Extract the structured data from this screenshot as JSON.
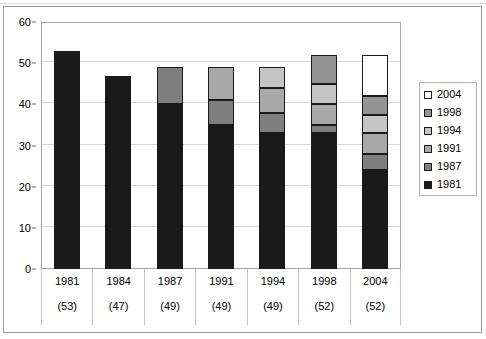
{
  "chart_data": {
    "type": "bar",
    "subtype": "stacked-bar",
    "title": "",
    "subtitle": "",
    "xlabel": "",
    "ylabel": "",
    "ylim": [
      0,
      60
    ],
    "ytick_step": 10,
    "yticks": [
      0,
      10,
      20,
      30,
      40,
      50,
      60
    ],
    "ytick_labels": [
      "0",
      "10",
      "20",
      "30",
      "40",
      "50",
      "60"
    ],
    "grid": true,
    "grid_axis": "y",
    "legend_position": "right",
    "categories": [
      "1981",
      "1984",
      "1987",
      "1991",
      "1994",
      "1998",
      "2004"
    ],
    "category_sublabels": [
      "(53)",
      "(47)",
      "(49)",
      "(49)",
      "(49)",
      "(52)",
      "(52)"
    ],
    "series": [
      {
        "name": "1981",
        "color": "#1a1a1a",
        "values": [
          53,
          47,
          40,
          35,
          33,
          33,
          24
        ]
      },
      {
        "name": "1987",
        "color": "#7f7f7f",
        "values": [
          0,
          0,
          9,
          6,
          5,
          2,
          4
        ]
      },
      {
        "name": "1991",
        "color": "#a8a8a8",
        "values": [
          0,
          0,
          0,
          8,
          6,
          5,
          5
        ]
      },
      {
        "name": "1994",
        "color": "#c4c4c4",
        "values": [
          0,
          0,
          0,
          0,
          5,
          5,
          4.5
        ]
      },
      {
        "name": "1998",
        "color": "#949494",
        "values": [
          0,
          0,
          0,
          0,
          0,
          7,
          4.5
        ]
      },
      {
        "name": "2004",
        "color": "#ffffff",
        "values": [
          0,
          0,
          0,
          0,
          0,
          0,
          10
        ]
      }
    ],
    "stack_totals": [
      53,
      47,
      49,
      49,
      49,
      52,
      52
    ]
  },
  "legend": {
    "entries": [
      {
        "label": "2004",
        "color": "#ffffff"
      },
      {
        "label": "1998",
        "color": "#949494"
      },
      {
        "label": "1994",
        "color": "#c4c4c4"
      },
      {
        "label": "1991",
        "color": "#a8a8a8"
      },
      {
        "label": "1987",
        "color": "#7f7f7f"
      },
      {
        "label": "1981",
        "color": "#1a1a1a"
      }
    ]
  },
  "colors": {
    "plot_border": "#a6a6a6",
    "outer_border": "#9a9a9a",
    "gridline": "#d9d9d9",
    "axis_text": "#000000",
    "bar_outline": "#1a1a1a",
    "background": "#ffffff"
  }
}
